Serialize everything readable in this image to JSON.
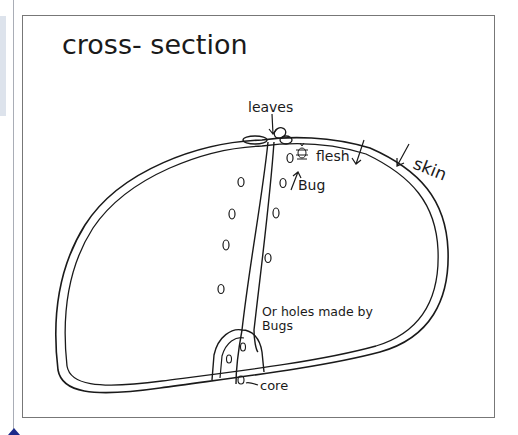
{
  "diagram": {
    "title": "cross- section",
    "labels": {
      "leaves": "leaves",
      "flesh": "flesh",
      "skin": "skin",
      "bug": "Bug",
      "holes_line1": "Or holes made by",
      "holes_line2": "Bugs",
      "core": "core"
    },
    "ink_color": "#1a1a1a",
    "frame_color": "#777777"
  }
}
